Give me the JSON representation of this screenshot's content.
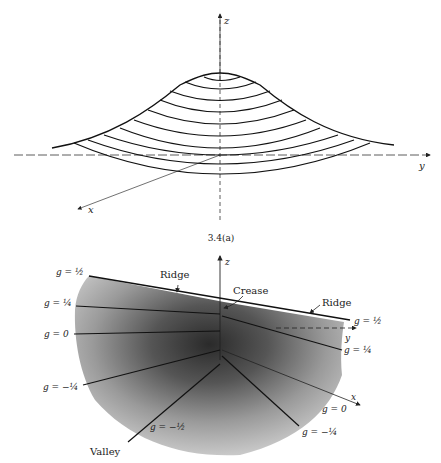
{
  "figure_top": {
    "axes": {
      "z": "z",
      "y": "y",
      "x": "x"
    },
    "contour_count": 10
  },
  "caption": "3.4(a)",
  "figure_bottom": {
    "axes": {
      "z": "z",
      "y": "y",
      "x": "x"
    },
    "annotations": {
      "ridge_left": "Ridge",
      "ridge_right": "Ridge",
      "crease": "Crease",
      "valley": "Valley"
    },
    "level_labels": {
      "left_half": "g = ½",
      "left_quarter": "g = ¼",
      "left_zero": "g = 0",
      "left_neg_quarter": "g = −¼",
      "bottom_neg_half": "g = −½",
      "right_half": "g = ½",
      "right_quarter": "g = ¼",
      "right_zero": "g = 0",
      "right_neg_quarter": "g = −¼"
    }
  }
}
